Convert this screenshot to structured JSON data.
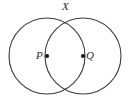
{
  "figure": {
    "background_color": "#ffffff",
    "stroke_color": "#3b3b40",
    "dot_color": "#1a1a1a",
    "canvas": {
      "width": 131,
      "height": 108
    },
    "circles": [
      {
        "name": "left-circle",
        "center_label": "P",
        "cx": 47,
        "cy": 56,
        "r": 38
      },
      {
        "name": "right-circle",
        "center_label": "Q",
        "cx": 83,
        "cy": 56,
        "r": 38
      }
    ],
    "points": [
      {
        "name": "intersection-top",
        "label": "X",
        "x": 65,
        "y": 18,
        "has_dot": false
      },
      {
        "name": "center-left",
        "label": "P",
        "x": 47,
        "y": 56,
        "has_dot": true
      },
      {
        "name": "center-right",
        "label": "Q",
        "x": 83,
        "y": 56,
        "has_dot": true
      }
    ],
    "labels": {
      "x": "X",
      "p": "P",
      "q": "Q"
    }
  }
}
